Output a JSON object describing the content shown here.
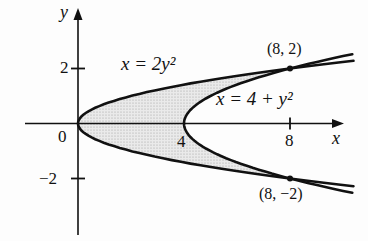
{
  "figure": {
    "colors": {
      "background": "#fdfdfd",
      "curve": "#111111",
      "axis": "#111111",
      "shade_base": "#eaeaea",
      "shade_dot": "#9d9d9d"
    },
    "axis": {
      "x_name": "x",
      "y_name": "y",
      "origin_label": "0",
      "x_ticks": [
        {
          "value": 4,
          "label": "4",
          "has_tick_mark": false
        },
        {
          "value": 8,
          "label": "8",
          "has_tick_mark": true
        }
      ],
      "y_ticks": [
        {
          "value": 2,
          "label": "2"
        },
        {
          "value": -2,
          "label": "−2"
        }
      ]
    },
    "curves": [
      {
        "name": "outer-parabola",
        "equation_label": "x = 2y²",
        "c0": 0,
        "c1": 2,
        "t_max": 2.28
      },
      {
        "name": "inner-parabola",
        "equation_label": "x = 4 + y²",
        "c0": 4,
        "c1": 1,
        "t_max": 2.52
      }
    ],
    "region": {
      "description": "shaded region bounded by x = 2y² and x = 4 + y²",
      "t_join": 2
    },
    "points": [
      {
        "x": 8,
        "y": 2,
        "label": "(8, 2)"
      },
      {
        "x": 8,
        "y": -2,
        "label": "(8, −2)"
      }
    ]
  }
}
